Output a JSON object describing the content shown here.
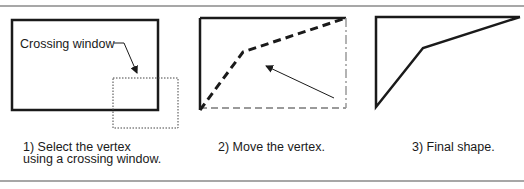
{
  "diagram": {
    "colors": {
      "line": "#1a1a1a",
      "rule": "#8a8a8a",
      "ghost": "#9a9a9a"
    },
    "panels": [
      {
        "step": 1,
        "label": "Crossing window",
        "caption_line1": "1) Select the vertex",
        "caption_line2": "using a crossing window."
      },
      {
        "step": 2,
        "caption_line1": "2) Move the vertex."
      },
      {
        "step": 3,
        "caption_line1": "3) Final shape."
      }
    ]
  }
}
